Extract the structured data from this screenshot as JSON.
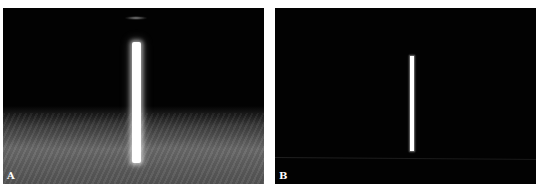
{
  "figure": {
    "panels": [
      {
        "label": "A",
        "description": "Bright vertical bar on dark background with grey haze in lower portion",
        "background_color": "#020202",
        "haze_color": "#6a6a6a",
        "bar_color": "#ffffff"
      },
      {
        "label": "B",
        "description": "Thin bright vertical bar on dark background",
        "background_color": "#020202",
        "bar_color": "#ffffff"
      }
    ]
  }
}
